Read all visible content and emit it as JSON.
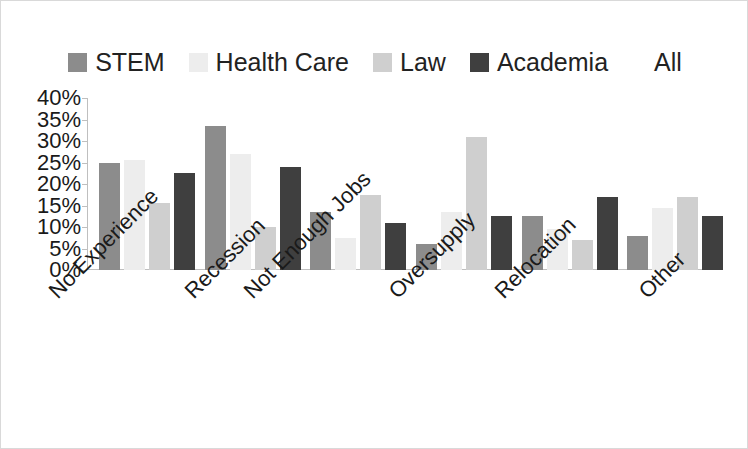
{
  "chart_data": {
    "type": "bar",
    "title": "",
    "subtitle": "",
    "xlabel": "",
    "ylabel": "",
    "ylim": [
      0,
      40
    ],
    "ytick_labels": [
      "40%",
      "35%",
      "30%",
      "25%",
      "20%",
      "15%",
      "10%",
      "5%",
      "0%"
    ],
    "ytick_values": [
      40,
      35,
      30,
      25,
      20,
      15,
      10,
      5,
      0
    ],
    "grid": false,
    "legend_position": "top",
    "categories": [
      "No Experience",
      "Recession",
      "Not Enough Jobs",
      "Oversupply",
      "Relocation",
      "Other"
    ],
    "series": [
      {
        "name": "STEM",
        "color": "#8c8c8c",
        "values": [
          25.0,
          33.5,
          13.5,
          6.0,
          12.5,
          8.0
        ]
      },
      {
        "name": "Health Care",
        "color": "#ededed",
        "values": [
          25.5,
          27.0,
          7.5,
          13.5,
          9.5,
          14.5
        ]
      },
      {
        "name": "Law",
        "color": "#cfcfcf",
        "values": [
          15.5,
          10.0,
          17.5,
          31.0,
          7.0,
          17.0
        ]
      },
      {
        "name": "Academia",
        "color": "#3f3f3f",
        "values": [
          22.5,
          24.0,
          11.0,
          12.5,
          17.0,
          12.5
        ]
      },
      {
        "name": "All",
        "color": "#ffffff",
        "values": [
          null,
          null,
          null,
          null,
          null,
          null
        ]
      }
    ]
  },
  "legend": {
    "items": [
      {
        "label": "STEM",
        "color": "#8c8c8c",
        "has_swatch": true
      },
      {
        "label": "Health Care",
        "color": "#ededed",
        "has_swatch": true
      },
      {
        "label": "Law",
        "color": "#cfcfcf",
        "has_swatch": true
      },
      {
        "label": "Academia",
        "color": "#3f3f3f",
        "has_swatch": true
      },
      {
        "label": "All",
        "color": "#ffffff",
        "has_swatch": false
      }
    ]
  },
  "colors": {
    "axis": "#bfbfbf",
    "text": "#1a1a1a",
    "border": "#d9d9d9",
    "background": "#ffffff"
  }
}
